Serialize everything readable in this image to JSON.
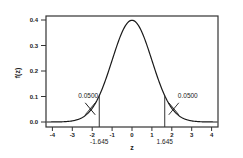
{
  "chart_data": {
    "type": "line",
    "title": "",
    "xlabel": "z",
    "ylabel": "f(z)",
    "xlim": [
      -4.3,
      4.3
    ],
    "ylim": [
      -0.005,
      0.41
    ],
    "x_ticks": [
      -4,
      -3,
      -2,
      -1,
      0,
      1,
      2,
      3,
      4
    ],
    "x_tick_labels": [
      "-4",
      "-3",
      "-2",
      "-1",
      "0",
      "1",
      "2",
      "3",
      "4"
    ],
    "y_ticks": [
      0.0,
      0.1,
      0.2,
      0.3,
      0.4
    ],
    "y_tick_labels": [
      "0.0",
      "0.1",
      "0.2",
      "0.3",
      "0.4"
    ],
    "grid": false,
    "legend": null,
    "series": [
      {
        "name": "standard normal density",
        "x": [
          -4.3,
          -4.0,
          -3.5,
          -3.0,
          -2.5,
          -2.0,
          -1.645,
          -1.5,
          -1.0,
          -0.5,
          0.0,
          0.5,
          1.0,
          1.5,
          1.645,
          2.0,
          2.5,
          3.0,
          3.5,
          4.0,
          4.3
        ],
        "y": [
          0.0,
          0.0001,
          0.0009,
          0.0044,
          0.0175,
          0.054,
          0.1031,
          0.1295,
          0.242,
          0.3521,
          0.3989,
          0.3521,
          0.242,
          0.1295,
          0.1031,
          0.054,
          0.0175,
          0.0044,
          0.0009,
          0.0001,
          0.0
        ]
      }
    ],
    "critical_values": [
      {
        "z": -1.645,
        "label": "-1.645"
      },
      {
        "z": 1.645,
        "label": "1.645"
      }
    ],
    "annotations": [
      {
        "text": "0.0500",
        "region": "left tail",
        "x": -2.1,
        "y": 0.04
      },
      {
        "text": "0.0500",
        "region": "right tail",
        "x": 2.1,
        "y": 0.04
      }
    ]
  }
}
